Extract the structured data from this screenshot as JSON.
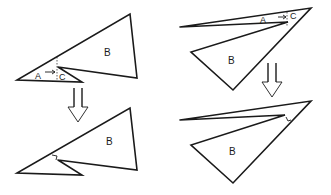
{
  "diagram": {
    "panels": [
      {
        "id": "left-before",
        "labels": {
          "a": "A",
          "b": "B",
          "c": "C"
        }
      },
      {
        "id": "left-after",
        "labels": {
          "b": "B"
        }
      },
      {
        "id": "right-before",
        "labels": {
          "a": "A",
          "b": "B",
          "c": "C"
        }
      },
      {
        "id": "right-after",
        "labels": {
          "b": "B"
        }
      }
    ],
    "arrows": [
      {
        "id": "left-transition",
        "direction": "down"
      },
      {
        "id": "right-transition",
        "direction": "down"
      }
    ],
    "colors": {
      "stroke": "#1a1a1a",
      "background": "#ffffff"
    }
  }
}
